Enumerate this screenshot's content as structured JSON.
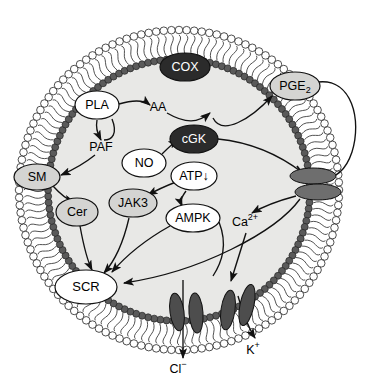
{
  "figure": {
    "type": "biological-pathway-diagram",
    "cell": {
      "shape": "circle",
      "cytosol_color": "#e8e8e6",
      "membrane": {
        "outer_leaflet_head_color": "#ffffff",
        "inner_leaflet_head_color": "#5a5a5a",
        "tail_color": "#333333",
        "description": "phospholipid bilayer drawn as head-group circles with wavy tails"
      }
    }
  },
  "nodes": [
    {
      "id": "cox",
      "label": "COX",
      "style": "dark-ellipse",
      "fill": "#2b2b2b",
      "text_color": "#ffffff",
      "x": 185,
      "y": 67,
      "rx": 25,
      "ry": 14
    },
    {
      "id": "pge2",
      "label": "PGE",
      "sub": "2",
      "style": "gray-ellipse",
      "fill": "#d4d4d2",
      "text_color": "#000000",
      "x": 295,
      "y": 86,
      "rx": 25,
      "ry": 14
    },
    {
      "id": "pla",
      "label": "PLA",
      "style": "white-ellipse",
      "fill": "#ffffff",
      "text_color": "#000000",
      "x": 97,
      "y": 105,
      "rx": 22,
      "ry": 14
    },
    {
      "id": "aa",
      "label": "AA",
      "style": "plain-text",
      "text_color": "#000000",
      "x": 158,
      "y": 107
    },
    {
      "id": "paf",
      "label": "PAF",
      "style": "plain-text",
      "text_color": "#000000",
      "x": 101,
      "y": 147
    },
    {
      "id": "cgk",
      "label": "cGK",
      "style": "dark-ellipse",
      "fill": "#2b2b2b",
      "text_color": "#ffffff",
      "x": 194,
      "y": 139,
      "rx": 24,
      "ry": 14
    },
    {
      "id": "no",
      "label": "NO",
      "style": "white-ellipse",
      "fill": "#ffffff",
      "text_color": "#000000",
      "x": 144,
      "y": 163,
      "rx": 22,
      "ry": 14
    },
    {
      "id": "atp",
      "label": "ATP↓",
      "style": "white-ellipse",
      "fill": "#ffffff",
      "text_color": "#000000",
      "x": 194,
      "y": 176,
      "rx": 23,
      "ry": 14
    },
    {
      "id": "sm",
      "label": "SM",
      "style": "gray-ellipse",
      "fill": "#d4d4d2",
      "text_color": "#000000",
      "x": 37,
      "y": 177,
      "rx": 23,
      "ry": 13
    },
    {
      "id": "jak3",
      "label": "JAK3",
      "style": "gray-ellipse",
      "fill": "#d4d4d2",
      "text_color": "#000000",
      "x": 133,
      "y": 203,
      "rx": 24,
      "ry": 14
    },
    {
      "id": "cer",
      "label": "Cer",
      "style": "gray-ellipse",
      "fill": "#d4d4d2",
      "text_color": "#000000",
      "x": 77,
      "y": 212,
      "rx": 21,
      "ry": 14
    },
    {
      "id": "ampk",
      "label": "AMPK",
      "style": "white-ellipse",
      "fill": "#ffffff",
      "text_color": "#000000",
      "x": 193,
      "y": 218,
      "rx": 27,
      "ry": 14
    },
    {
      "id": "ca",
      "label": "Ca",
      "sup": "2+",
      "style": "plain-text",
      "text_color": "#000000",
      "x": 245,
      "y": 222
    },
    {
      "id": "scr",
      "label": "SCR",
      "style": "white-ellipse",
      "fill": "#ffffff",
      "text_color": "#000000",
      "x": 86,
      "y": 287,
      "rx": 31,
      "ry": 17
    }
  ],
  "channels": [
    {
      "id": "channel-pge2-receptor-upper",
      "orientation": "horizontal",
      "fill": "#6e6e6e",
      "x": 313,
      "y": 176,
      "rx": 23,
      "ry": 8
    },
    {
      "id": "channel-pge2-receptor-lower",
      "orientation": "horizontal",
      "fill": "#6e6e6e",
      "x": 318,
      "y": 192,
      "rx": 23,
      "ry": 8
    },
    {
      "id": "channel-chloride-left",
      "orientation": "vertical",
      "fill": "#4d4d4d",
      "x": 177,
      "y": 312,
      "rx": 7,
      "ry": 19,
      "rot": -8
    },
    {
      "id": "channel-chloride-right",
      "orientation": "vertical",
      "fill": "#4d4d4d",
      "x": 196,
      "y": 313,
      "rx": 7,
      "ry": 20,
      "rot": -4
    },
    {
      "id": "channel-potassium-left",
      "orientation": "vertical",
      "fill": "#4d4d4d",
      "x": 228,
      "y": 310,
      "rx": 7,
      "ry": 20,
      "rot": 8
    },
    {
      "id": "channel-potassium-right",
      "orientation": "vertical",
      "fill": "#4d4d4d",
      "x": 247,
      "y": 305,
      "rx": 7,
      "ry": 21,
      "rot": 12
    }
  ],
  "ion_labels": [
    {
      "id": "chloride",
      "label": "Cl",
      "sup": "−",
      "x": 178,
      "y": 370
    },
    {
      "id": "potassium",
      "label": "K",
      "sup": "+",
      "x": 253,
      "y": 351
    }
  ],
  "edges": [
    {
      "id": "pla-to-aa",
      "from": "PLA",
      "to": "AA",
      "kind": "activation"
    },
    {
      "id": "pla-to-paf",
      "from": "PLA",
      "to": "PAF",
      "kind": "activation"
    },
    {
      "id": "aa-to-cox",
      "from": "AA",
      "to": "COX",
      "kind": "activation"
    },
    {
      "id": "cox-to-pge2",
      "from": "COX",
      "to": "PGE2",
      "kind": "activation"
    },
    {
      "id": "pge2-to-receptor",
      "from": "PGE2",
      "to": "channel-pge2-receptor-upper",
      "kind": "activation",
      "path": "external-loop"
    },
    {
      "id": "paf-to-sm",
      "from": "PAF",
      "to": "SM",
      "kind": "activation"
    },
    {
      "id": "sm-to-cer",
      "from": "SM",
      "to": "Cer",
      "kind": "activation"
    },
    {
      "id": "cer-to-scr",
      "from": "Cer",
      "to": "SCR",
      "kind": "activation"
    },
    {
      "id": "no-to-cgk",
      "from": "NO",
      "to": "cGK",
      "kind": "activation"
    },
    {
      "id": "cgk-to-receptor",
      "from": "cGK",
      "to": "channel-pge2-receptor-upper",
      "kind": "inhibition"
    },
    {
      "id": "atp-to-jak3",
      "from": "ATP↓",
      "to": "JAK3",
      "kind": "activation"
    },
    {
      "id": "atp-to-ampk",
      "from": "ATP↓",
      "to": "AMPK",
      "kind": "activation"
    },
    {
      "id": "jak3-to-scr",
      "from": "JAK3",
      "to": "SCR",
      "kind": "activation"
    },
    {
      "id": "ampk-to-scr",
      "from": "AMPK",
      "to": "SCR",
      "kind": "activation"
    },
    {
      "id": "receptor-to-ca",
      "from": "channel-pge2-receptor-lower",
      "to": "Ca2+",
      "kind": "activation"
    },
    {
      "id": "ca-to-kchannel",
      "from": "Ca2+",
      "to": "channel-potassium-left",
      "kind": "activation"
    },
    {
      "id": "receptor-to-scr",
      "from": "channel-pge2-receptor-lower",
      "to": "SCR",
      "kind": "activation"
    },
    {
      "id": "cl-efflux",
      "from": "channel-chloride",
      "to": "Cl-",
      "kind": "transport"
    },
    {
      "id": "k-efflux",
      "from": "channel-potassium",
      "to": "K+",
      "kind": "transport"
    }
  ]
}
